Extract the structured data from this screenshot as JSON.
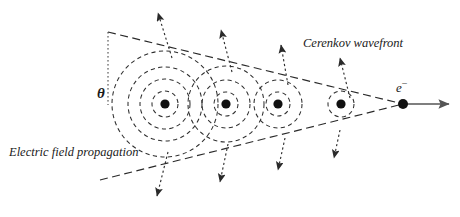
{
  "figure": {
    "background": "#ffffff",
    "ink": "#2a2a2a",
    "width": 460,
    "height": 217
  },
  "labels": {
    "wavefront": "Cerenkov wavefront",
    "electric_field": "Electric field propagation",
    "angle": "θ",
    "particle": "e",
    "particle_charge": "−"
  },
  "chart_data": {
    "type": "diagram",
    "emission_points": [
      {
        "id": "source-1",
        "x": 165,
        "y": 104,
        "radii": [
          13,
          25,
          37,
          53
        ]
      },
      {
        "id": "source-2",
        "x": 226,
        "y": 104,
        "radii": [
          12,
          24,
          38
        ]
      },
      {
        "id": "source-3",
        "x": 278,
        "y": 104,
        "radii": [
          12,
          24
        ]
      },
      {
        "id": "source-4",
        "x": 341,
        "y": 104,
        "radii": [
          13
        ]
      }
    ],
    "particle": {
      "label": "e-",
      "x": 403,
      "y": 104,
      "dot_radius": 5
    },
    "track_arrow": {
      "x1": 403,
      "y1": 104,
      "x2": 449,
      "y2": 104
    },
    "cone": {
      "apex": [
        403,
        104
      ],
      "upper_end": [
        108,
        32
      ],
      "lower_end": [
        100,
        180
      ],
      "half_angle_label": "θ"
    },
    "angle_marker": {
      "vertex": [
        108,
        32
      ],
      "vertical_to": [
        108,
        105
      ]
    },
    "wavefront_normal_arrows": [
      {
        "from": [
          172,
          58
        ],
        "to": [
          158,
          13
        ]
      },
      {
        "from": [
          232,
          72
        ],
        "to": [
          221,
          30
        ]
      },
      {
        "from": [
          288,
          85
        ],
        "to": [
          281,
          45
        ]
      },
      {
        "from": [
          350,
          98
        ],
        "to": [
          340,
          58
        ]
      },
      {
        "from": [
          168,
          152
        ],
        "to": [
          157,
          196
        ]
      },
      {
        "from": [
          228,
          144
        ],
        "to": [
          220,
          182
        ]
      },
      {
        "from": [
          285,
          138
        ],
        "to": [
          278,
          170
        ]
      },
      {
        "from": [
          340,
          130
        ],
        "to": [
          334,
          158
        ]
      }
    ],
    "style": {
      "circle_stroke": "dashed",
      "cone_stroke": "dashed",
      "arrow_stroke": "dotted",
      "grid": false,
      "legend": false
    }
  }
}
